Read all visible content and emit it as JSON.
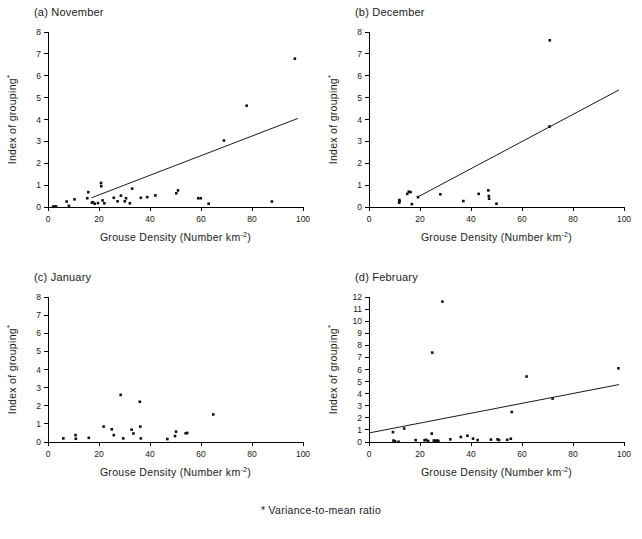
{
  "figure": {
    "footnote": "* Variance-to-mean ratio",
    "xlabel_main": "Grouse Density (Number km",
    "xlabel_sup": "-2",
    "xlabel_close": ")",
    "ylabel_main": "Index of grouping",
    "ylabel_sup": "*"
  },
  "panels": [
    {
      "title": "(a)  November",
      "key": "november"
    },
    {
      "title": "(b)  December",
      "key": "december"
    },
    {
      "title": "(c)  January",
      "key": "january"
    },
    {
      "title": "(d)  February",
      "key": "february"
    }
  ],
  "chart_data": [
    {
      "type": "scatter",
      "title": "(a)  November",
      "xlabel": "Grouse Density (Number km-2)",
      "ylabel": "Index of grouping*",
      "xlim": [
        0,
        100
      ],
      "ylim": [
        0,
        8
      ],
      "xticks": [
        0,
        20,
        40,
        60,
        80,
        100
      ],
      "yticks": [
        0,
        1,
        2,
        3,
        4,
        5,
        6,
        7,
        8
      ],
      "grid": false,
      "legend": false,
      "points": [
        {
          "x": 2.0,
          "y": 0.02
        },
        {
          "x": 2.6,
          "y": 0.02
        },
        {
          "x": 3.2,
          "y": 0.02
        },
        {
          "x": 7.3,
          "y": 0.25
        },
        {
          "x": 8.2,
          "y": 0.05
        },
        {
          "x": 10.4,
          "y": 0.35
        },
        {
          "x": 15.4,
          "y": 0.4
        },
        {
          "x": 15.8,
          "y": 0.68
        },
        {
          "x": 17.2,
          "y": 0.2
        },
        {
          "x": 17.6,
          "y": 0.22
        },
        {
          "x": 18.3,
          "y": 0.15
        },
        {
          "x": 19.6,
          "y": 0.18
        },
        {
          "x": 20.8,
          "y": 1.1
        },
        {
          "x": 20.9,
          "y": 0.95
        },
        {
          "x": 21.4,
          "y": 0.3
        },
        {
          "x": 22.1,
          "y": 0.17
        },
        {
          "x": 25.8,
          "y": 0.42
        },
        {
          "x": 27.3,
          "y": 0.26
        },
        {
          "x": 28.6,
          "y": 0.52
        },
        {
          "x": 30.1,
          "y": 0.26
        },
        {
          "x": 30.6,
          "y": 0.4
        },
        {
          "x": 32.1,
          "y": 0.17
        },
        {
          "x": 33.0,
          "y": 0.84
        },
        {
          "x": 36.4,
          "y": 0.42
        },
        {
          "x": 38.9,
          "y": 0.45
        },
        {
          "x": 42.1,
          "y": 0.53
        },
        {
          "x": 50.3,
          "y": 0.63
        },
        {
          "x": 51.0,
          "y": 0.76
        },
        {
          "x": 58.9,
          "y": 0.4
        },
        {
          "x": 59.9,
          "y": 0.4
        },
        {
          "x": 63.0,
          "y": 0.15
        },
        {
          "x": 69.0,
          "y": 3.04
        },
        {
          "x": 77.9,
          "y": 4.63
        },
        {
          "x": 87.8,
          "y": 0.25
        },
        {
          "x": 96.8,
          "y": 6.78
        }
      ],
      "regression": {
        "x0": 17.0,
        "y0": 0.42,
        "x1": 98.0,
        "y1": 4.05
      }
    },
    {
      "type": "scatter",
      "title": "(b)  December",
      "xlabel": "Grouse Density (Number km-2)",
      "ylabel": "Index of grouping*",
      "xlim": [
        0,
        100
      ],
      "ylim": [
        0,
        8
      ],
      "xticks": [
        0,
        20,
        40,
        60,
        80,
        100
      ],
      "yticks": [
        0,
        1,
        2,
        3,
        4,
        5,
        6,
        7,
        8
      ],
      "grid": false,
      "legend": false,
      "points": [
        {
          "x": 11.8,
          "y": 0.2
        },
        {
          "x": 11.9,
          "y": 0.32
        },
        {
          "x": 12.0,
          "y": 0.26
        },
        {
          "x": 15.0,
          "y": 0.6
        },
        {
          "x": 15.6,
          "y": 0.7
        },
        {
          "x": 16.3,
          "y": 0.68
        },
        {
          "x": 16.8,
          "y": 0.13
        },
        {
          "x": 19.2,
          "y": 0.45
        },
        {
          "x": 28.0,
          "y": 0.58
        },
        {
          "x": 37.0,
          "y": 0.27
        },
        {
          "x": 43.0,
          "y": 0.6
        },
        {
          "x": 46.8,
          "y": 0.76
        },
        {
          "x": 47.0,
          "y": 0.5
        },
        {
          "x": 47.1,
          "y": 0.38
        },
        {
          "x": 50.0,
          "y": 0.15
        },
        {
          "x": 70.8,
          "y": 3.68
        },
        {
          "x": 70.9,
          "y": 7.62
        }
      ],
      "regression": {
        "x0": 19.0,
        "y0": 0.45,
        "x1": 98.0,
        "y1": 5.35
      }
    },
    {
      "type": "scatter",
      "title": "(c)  January",
      "xlabel": "Grouse Density (Number km-2)",
      "ylabel": "Index of grouping*",
      "xlim": [
        0,
        100
      ],
      "ylim": [
        0,
        8
      ],
      "xticks": [
        0,
        20,
        40,
        60,
        80,
        100
      ],
      "yticks": [
        0,
        1,
        2,
        3,
        4,
        5,
        6,
        7,
        8
      ],
      "grid": false,
      "legend": false,
      "points": [
        {
          "x": 6.0,
          "y": 0.2
        },
        {
          "x": 10.8,
          "y": 0.38
        },
        {
          "x": 10.9,
          "y": 0.18
        },
        {
          "x": 16.0,
          "y": 0.23
        },
        {
          "x": 21.8,
          "y": 0.85
        },
        {
          "x": 25.0,
          "y": 0.7
        },
        {
          "x": 25.8,
          "y": 0.38
        },
        {
          "x": 28.5,
          "y": 2.6
        },
        {
          "x": 29.5,
          "y": 0.2
        },
        {
          "x": 32.8,
          "y": 0.68
        },
        {
          "x": 33.5,
          "y": 0.47
        },
        {
          "x": 36.0,
          "y": 2.22
        },
        {
          "x": 36.2,
          "y": 0.85
        },
        {
          "x": 36.4,
          "y": 0.2
        },
        {
          "x": 46.8,
          "y": 0.16
        },
        {
          "x": 49.8,
          "y": 0.33
        },
        {
          "x": 50.2,
          "y": 0.57
        },
        {
          "x": 54.0,
          "y": 0.48
        },
        {
          "x": 54.6,
          "y": 0.5
        },
        {
          "x": 64.8,
          "y": 1.52
        }
      ],
      "regression": null
    },
    {
      "type": "scatter",
      "title": "(d)  February",
      "xlabel": "Grouse Density (Number km-2)",
      "ylabel": "Index of grouping*",
      "xlim": [
        0,
        100
      ],
      "ylim": [
        0,
        12
      ],
      "xticks": [
        0,
        20,
        40,
        60,
        80,
        100
      ],
      "yticks": [
        0,
        1,
        2,
        3,
        4,
        5,
        6,
        7,
        8,
        9,
        10,
        11,
        12
      ],
      "grid": false,
      "legend": false,
      "points": [
        {
          "x": 9.4,
          "y": 0.82
        },
        {
          "x": 9.6,
          "y": 0.12
        },
        {
          "x": 10.2,
          "y": 0.06
        },
        {
          "x": 11.6,
          "y": 0.02
        },
        {
          "x": 13.8,
          "y": 1.12
        },
        {
          "x": 18.3,
          "y": 0.16
        },
        {
          "x": 21.8,
          "y": 0.14
        },
        {
          "x": 22.4,
          "y": 0.18
        },
        {
          "x": 23.2,
          "y": 0.08
        },
        {
          "x": 24.6,
          "y": 0.7
        },
        {
          "x": 24.8,
          "y": 7.4
        },
        {
          "x": 25.4,
          "y": 0.12
        },
        {
          "x": 26.0,
          "y": 0.1
        },
        {
          "x": 26.6,
          "y": 0.12
        },
        {
          "x": 27.2,
          "y": 0.09
        },
        {
          "x": 28.8,
          "y": 11.62
        },
        {
          "x": 31.9,
          "y": 0.22
        },
        {
          "x": 36.0,
          "y": 0.42
        },
        {
          "x": 38.6,
          "y": 0.52
        },
        {
          "x": 40.8,
          "y": 0.28
        },
        {
          "x": 42.6,
          "y": 0.16
        },
        {
          "x": 47.8,
          "y": 0.2
        },
        {
          "x": 50.4,
          "y": 0.22
        },
        {
          "x": 51.0,
          "y": 0.16
        },
        {
          "x": 54.2,
          "y": 0.18
        },
        {
          "x": 55.6,
          "y": 0.27
        },
        {
          "x": 56.0,
          "y": 2.48
        },
        {
          "x": 61.8,
          "y": 5.42
        },
        {
          "x": 72.0,
          "y": 3.6
        },
        {
          "x": 97.8,
          "y": 6.1
        }
      ],
      "regression": {
        "x0": 0.0,
        "y0": 0.75,
        "x1": 98.0,
        "y1": 4.75
      }
    }
  ]
}
